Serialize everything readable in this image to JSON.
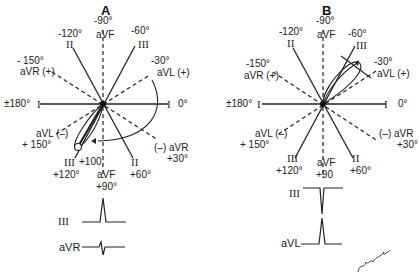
{
  "panels": [
    {
      "title": "A",
      "labels": {
        "top_angle": "-90°",
        "top_lead": "aVF",
        "ul_angle": "-120°",
        "ul_lead": "II",
        "ur_angle": "-60°",
        "ur_lead": "III",
        "l_angle": "- 150°",
        "l_lead": "aVR (+)",
        "r_angle": "-30°",
        "r_lead": "aVL  (+)",
        "left_axis": "±180°",
        "left_lead": "I",
        "right_lead": "I",
        "right_angle": "0°",
        "ll_lead": "aVL (–)",
        "ll_angle": "+ 150°",
        "lr_lead": "(–) aVR",
        "lr_angle": "+30°",
        "bl_lead": "III",
        "bl_angle": "+120°",
        "b_lead": "aVF",
        "b_angle": "+90°",
        "br_lead": "II",
        "br_angle": "+60°",
        "axis_value": "+100"
      },
      "tracings": [
        {
          "lead": "III",
          "shape": "positive-spike"
        },
        {
          "lead": "aVR",
          "shape": "biphasic"
        }
      ]
    },
    {
      "title": "B",
      "labels": {
        "top_angle": "-90°",
        "top_lead": "aVF",
        "ul_angle": "-120°",
        "ul_lead": "II",
        "ur_angle": "-60°",
        "ur_lead": "III",
        "l_angle": "-150°",
        "l_lead": "aVR (+)",
        "r_angle": "-30°",
        "r_lead": "aVL  (+)",
        "left_axis": "±180°",
        "left_lead": "I",
        "right_lead": "I",
        "right_angle": "0°",
        "ll_lead": "aVL (–)",
        "ll_angle": "+ 150°",
        "lr_lead": "(–)  aVR",
        "lr_angle": "+30°",
        "bl_lead": "III",
        "bl_angle": "+120°",
        "b_lead": "aVF",
        "b_angle": "+90",
        "br_lead": "II",
        "br_angle": "+60°"
      },
      "tracings": [
        {
          "lead": "III",
          "shape": "negative-spike"
        },
        {
          "lead": "aVL",
          "shape": "positive-spike"
        }
      ]
    }
  ],
  "signature": "artist signature"
}
